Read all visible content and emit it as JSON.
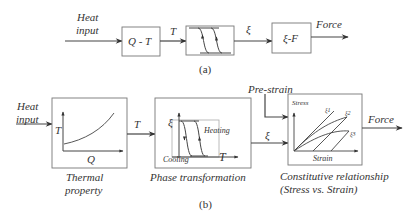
{
  "panel_a": {
    "caption": "(a)",
    "input_label_line1": "Heat",
    "input_label_line2": "input",
    "block1_label": "Q - T",
    "signal1_label": "T",
    "block2_label": "",
    "signal2_label": "ξ",
    "block3_label": "ξ-F",
    "output_label": "Force"
  },
  "panel_b": {
    "caption": "(b)",
    "input_label_line1": "Heat",
    "input_label_line2": "input",
    "thermal": {
      "y_axis": "T",
      "x_axis": "Q",
      "caption_line1": "Thermal",
      "caption_line2": "property"
    },
    "signal1_label": "T",
    "phase": {
      "y_axis": "ξ",
      "x_axis": "T",
      "heating_label": "Heating",
      "cooling_label": "Cooling",
      "caption": "Phase transformation"
    },
    "prestrain_label": "Pre-strain",
    "signal2_label": "ξ",
    "constitutive": {
      "y_axis": "Stress",
      "x_axis": "Strain",
      "curve_labels": [
        "ξ1",
        "ξ2",
        "ξ3"
      ],
      "caption_line1": "Constitutive relationship",
      "caption_line2": "(Stress vs. Strain)"
    },
    "output_label": "Force"
  },
  "colors": {
    "line": "#444444",
    "box": "#666666",
    "text": "#333333"
  }
}
